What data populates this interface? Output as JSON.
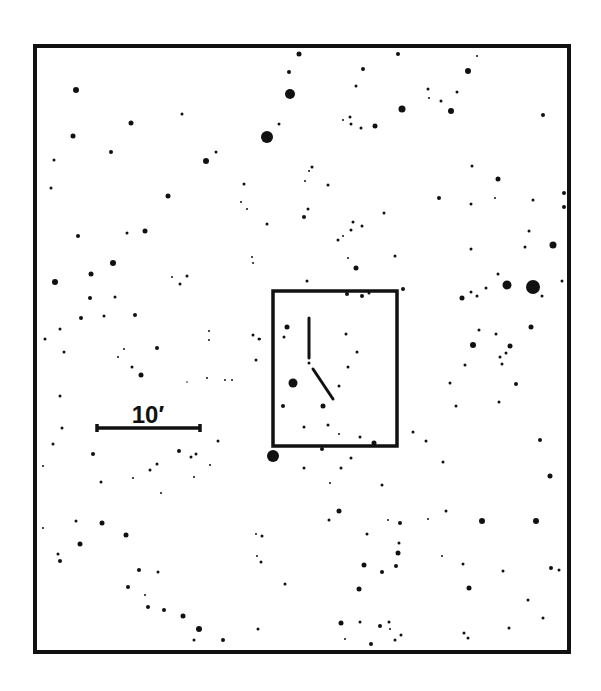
{
  "chart_data": {
    "type": "scatter",
    "title": "",
    "frame": {
      "x1": 35,
      "y1": 46,
      "x2": 569,
      "y2": 652,
      "stroke": "#111111",
      "width": 4
    },
    "field_box": {
      "x1": 273,
      "y1": 291,
      "x2": 397,
      "y2": 446,
      "stroke": "#111111",
      "width": 3.5
    },
    "marker_lines": [
      {
        "name": "north-marker",
        "x1": 309,
        "y1": 318,
        "x2": 309,
        "y2": 358
      },
      {
        "name": "diagonal-marker",
        "x1": 313,
        "y1": 369,
        "x2": 333,
        "y2": 399
      }
    ],
    "scale_bar": {
      "x1": 97,
      "x2": 200,
      "y": 428,
      "label": "10′",
      "label_x": 148,
      "label_y": 423
    },
    "stars": [
      [
        299,
        54,
        2.5
      ],
      [
        289,
        72,
        2
      ],
      [
        290,
        94,
        5
      ],
      [
        76,
        90,
        3
      ],
      [
        182,
        114,
        1.5
      ],
      [
        131,
        123,
        2.5
      ],
      [
        73,
        136,
        2.5
      ],
      [
        267,
        137,
        6
      ],
      [
        279,
        124,
        1.5
      ],
      [
        111,
        152,
        2
      ],
      [
        216,
        152,
        1.5
      ],
      [
        206,
        161,
        3
      ],
      [
        54,
        160,
        1.5
      ],
      [
        51,
        188,
        1.5
      ],
      [
        168,
        196,
        2.5
      ],
      [
        244,
        184,
        1.5
      ],
      [
        241,
        202,
        1
      ],
      [
        247,
        209,
        1
      ],
      [
        267,
        224,
        1.5
      ],
      [
        78,
        236,
        2
      ],
      [
        127,
        233,
        1.5
      ],
      [
        145,
        231,
        2.5
      ],
      [
        113,
        263,
        3
      ],
      [
        252,
        257,
        1
      ],
      [
        253,
        263,
        1
      ],
      [
        305,
        181,
        1
      ],
      [
        304,
        217,
        2
      ],
      [
        308,
        209,
        1.5
      ],
      [
        398,
        54,
        2
      ],
      [
        477,
        56,
        1
      ],
      [
        363,
        69,
        2
      ],
      [
        468,
        71,
        3
      ],
      [
        356,
        86,
        1.5
      ],
      [
        428,
        89,
        1.5
      ],
      [
        457,
        92,
        1.5
      ],
      [
        429,
        98,
        1
      ],
      [
        441,
        101,
        1.5
      ],
      [
        402,
        109,
        3.5
      ],
      [
        451,
        111,
        3
      ],
      [
        543,
        115,
        2
      ],
      [
        350,
        117,
        1.5
      ],
      [
        343,
        120,
        1
      ],
      [
        351,
        124,
        1.5
      ],
      [
        361,
        128,
        1.5
      ],
      [
        375,
        126,
        2.5
      ],
      [
        472,
        166,
        1.5
      ],
      [
        498,
        179,
        2.5
      ],
      [
        312,
        167,
        1.5
      ],
      [
        309,
        171,
        1
      ],
      [
        328,
        185,
        1.5
      ],
      [
        439,
        198,
        2
      ],
      [
        471,
        204,
        1.5
      ],
      [
        495,
        198,
        1
      ],
      [
        533,
        200,
        1.5
      ],
      [
        564,
        193,
        2
      ],
      [
        564,
        207,
        2
      ],
      [
        384,
        213,
        1.5
      ],
      [
        353,
        222,
        1.5
      ],
      [
        362,
        226,
        1.5
      ],
      [
        351,
        230,
        1.5
      ],
      [
        343,
        236,
        1
      ],
      [
        338,
        240,
        1.5
      ],
      [
        529,
        231,
        1.5
      ],
      [
        553,
        245,
        3.5
      ],
      [
        525,
        247,
        1.5
      ],
      [
        471,
        249,
        1.5
      ],
      [
        348,
        258,
        1
      ],
      [
        395,
        256,
        1.5
      ],
      [
        356,
        268,
        2.5
      ],
      [
        91,
        274,
        2.5
      ],
      [
        55,
        282,
        3
      ],
      [
        172,
        277,
        1
      ],
      [
        187,
        276,
        1.5
      ],
      [
        180,
        284,
        1.5
      ],
      [
        90,
        298,
        2
      ],
      [
        115,
        297,
        1.5
      ],
      [
        81,
        318,
        2
      ],
      [
        104,
        316,
        1.5
      ],
      [
        135,
        315,
        2
      ],
      [
        60,
        329,
        1.5
      ],
      [
        45,
        339,
        1.5
      ],
      [
        64,
        352,
        1.5
      ],
      [
        124,
        349,
        1
      ],
      [
        118,
        357,
        1
      ],
      [
        157,
        348,
        2
      ],
      [
        209,
        331,
        1
      ],
      [
        209,
        340,
        1
      ],
      [
        253,
        335,
        1.5
      ],
      [
        259,
        339,
        1.5
      ],
      [
        256,
        360,
        1.5
      ],
      [
        132,
        367,
        1.5
      ],
      [
        141,
        375,
        2.5
      ],
      [
        187,
        382,
        0.8
      ],
      [
        207,
        378,
        1
      ],
      [
        225,
        380,
        1
      ],
      [
        232,
        380,
        1
      ],
      [
        60,
        396,
        1.5
      ],
      [
        62,
        428,
        1.5
      ],
      [
        53,
        444,
        1.5
      ],
      [
        218,
        441,
        1.5
      ],
      [
        93,
        454,
        2
      ],
      [
        179,
        451,
        2
      ],
      [
        196,
        454,
        1.5
      ],
      [
        191,
        457,
        1.5
      ],
      [
        307,
        281,
        1.5
      ],
      [
        347,
        294,
        2
      ],
      [
        362,
        296,
        2
      ],
      [
        369,
        293,
        1.5
      ],
      [
        403,
        289,
        2
      ],
      [
        287,
        327,
        2.5
      ],
      [
        284,
        337,
        1.5
      ],
      [
        260,
        339,
        1
      ],
      [
        346,
        334,
        1.5
      ],
      [
        357,
        352,
        1.5
      ],
      [
        309,
        363,
        1.5
      ],
      [
        348,
        367,
        1.5
      ],
      [
        293,
        383,
        4.5
      ],
      [
        339,
        386,
        1.5
      ],
      [
        283,
        406,
        2
      ],
      [
        323,
        406,
        2.5
      ],
      [
        304,
        427,
        1.5
      ],
      [
        328,
        425,
        1.5
      ],
      [
        339,
        434,
        1
      ],
      [
        360,
        437,
        1.5
      ],
      [
        374,
        443,
        2.5
      ],
      [
        413,
        432,
        1.5
      ],
      [
        273,
        456,
        6
      ],
      [
        322,
        449,
        2
      ],
      [
        351,
        458,
        1.5
      ],
      [
        304,
        468,
        1.5
      ],
      [
        341,
        468,
        1.5
      ],
      [
        498,
        274,
        1.5
      ],
      [
        507,
        285,
        4.5
      ],
      [
        533,
        287,
        7
      ],
      [
        562,
        281,
        1.5
      ],
      [
        462,
        298,
        2.5
      ],
      [
        471,
        292,
        1.5
      ],
      [
        477,
        296,
        1.5
      ],
      [
        486,
        288,
        1.5
      ],
      [
        542,
        296,
        1.5
      ],
      [
        479,
        330,
        1.5
      ],
      [
        496,
        334,
        1.5
      ],
      [
        531,
        327,
        2.5
      ],
      [
        473,
        345,
        3
      ],
      [
        510,
        346,
        2.5
      ],
      [
        506,
        353,
        1.5
      ],
      [
        500,
        357,
        1.5
      ],
      [
        502,
        364,
        1.5
      ],
      [
        465,
        365,
        1.5
      ],
      [
        450,
        383,
        1.5
      ],
      [
        516,
        384,
        2
      ],
      [
        456,
        406,
        1.5
      ],
      [
        499,
        402,
        1.5
      ],
      [
        426,
        441,
        1.5
      ],
      [
        540,
        440,
        2
      ],
      [
        43,
        466,
        1
      ],
      [
        157,
        464,
        1.5
      ],
      [
        150,
        470,
        1.5
      ],
      [
        210,
        465,
        1
      ],
      [
        101,
        482,
        1.5
      ],
      [
        133,
        478,
        1
      ],
      [
        194,
        477,
        1
      ],
      [
        161,
        493,
        1
      ],
      [
        76,
        521,
        1.5
      ],
      [
        102,
        523,
        2.5
      ],
      [
        43,
        528,
        1
      ],
      [
        126,
        535,
        2.5
      ],
      [
        80,
        544,
        2.5
      ],
      [
        58,
        554,
        1.5
      ],
      [
        60,
        561,
        2
      ],
      [
        256,
        534,
        1
      ],
      [
        262,
        536,
        1.5
      ],
      [
        257,
        556,
        1
      ],
      [
        261,
        562,
        1.5
      ],
      [
        139,
        570,
        2
      ],
      [
        158,
        572,
        1.5
      ],
      [
        128,
        587,
        2
      ],
      [
        145,
        595,
        1
      ],
      [
        148,
        607,
        2
      ],
      [
        164,
        610,
        2
      ],
      [
        183,
        616,
        2.5
      ],
      [
        199,
        629,
        3
      ],
      [
        258,
        629,
        1.5
      ],
      [
        285,
        584,
        1.5
      ],
      [
        194,
        640,
        1.5
      ],
      [
        223,
        640,
        2
      ],
      [
        443,
        462,
        1.5
      ],
      [
        550,
        476,
        2.5
      ],
      [
        330,
        483,
        1
      ],
      [
        382,
        485,
        1.5
      ],
      [
        339,
        511,
        2.5
      ],
      [
        446,
        511,
        1.5
      ],
      [
        329,
        520,
        1.5
      ],
      [
        388,
        520,
        1
      ],
      [
        400,
        523,
        2
      ],
      [
        428,
        519,
        1
      ],
      [
        482,
        521,
        3
      ],
      [
        536,
        521,
        3
      ],
      [
        367,
        534,
        1.5
      ],
      [
        399,
        543,
        1.5
      ],
      [
        398,
        553,
        2.5
      ],
      [
        364,
        565,
        2.5
      ],
      [
        382,
        572,
        2
      ],
      [
        396,
        566,
        2
      ],
      [
        442,
        556,
        1
      ],
      [
        463,
        564,
        1.5
      ],
      [
        503,
        571,
        1.5
      ],
      [
        551,
        568,
        2
      ],
      [
        559,
        570,
        1.5
      ],
      [
        359,
        589,
        2.5
      ],
      [
        469,
        588,
        2.5
      ],
      [
        528,
        600,
        1.5
      ],
      [
        543,
        618,
        1.5
      ],
      [
        341,
        623,
        2.5
      ],
      [
        360,
        622,
        1.5
      ],
      [
        380,
        626,
        2
      ],
      [
        389,
        622,
        1.5
      ],
      [
        390,
        629,
        1
      ],
      [
        345,
        639,
        1
      ],
      [
        371,
        644,
        2
      ],
      [
        395,
        640,
        1.5
      ],
      [
        401,
        635,
        1.5
      ],
      [
        464,
        633,
        1.5
      ],
      [
        468,
        638,
        1.5
      ],
      [
        509,
        628,
        1.5
      ]
    ],
    "star_format": [
      "x",
      "y",
      "radius"
    ],
    "colors": {
      "ink": "#111111",
      "background": "#ffffff"
    }
  },
  "scale": {
    "label": "10′"
  }
}
